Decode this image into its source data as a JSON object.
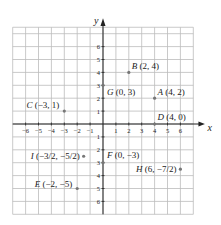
{
  "chart_data": {
    "type": "scatter",
    "title": "",
    "xlabel": "x",
    "ylabel": "y",
    "xlim": [
      -7,
      7
    ],
    "ylim": [
      -7,
      7
    ],
    "grid": true,
    "x_ticks": [
      -6,
      -5,
      -4,
      -3,
      -2,
      -1,
      1,
      2,
      3,
      4,
      5,
      6
    ],
    "y_ticks": [
      -6,
      -5,
      -4,
      -3,
      -2,
      -1,
      1,
      2,
      3,
      4,
      5,
      6
    ],
    "points": [
      {
        "name": "A",
        "x": 4,
        "y": 2,
        "label": "A (4, 2)"
      },
      {
        "name": "B",
        "x": 2,
        "y": 4,
        "label": "B (2, 4)"
      },
      {
        "name": "C",
        "x": -3,
        "y": 1,
        "label": "C (−3, 1)"
      },
      {
        "name": "D",
        "x": 4,
        "y": 0,
        "label": "D (4, 0)"
      },
      {
        "name": "E",
        "x": -2,
        "y": -5,
        "label": "E (−2, −5)"
      },
      {
        "name": "F",
        "x": 0,
        "y": -3,
        "label": "F (0, −3)"
      },
      {
        "name": "G",
        "x": 0,
        "y": 3,
        "label": "G (0, 3)"
      },
      {
        "name": "H",
        "x": 6,
        "y": -3.5,
        "label": "H (6, −7/2)"
      },
      {
        "name": "I",
        "x": -1.5,
        "y": -2.5,
        "label": "I (−3/2, −5/2)"
      }
    ]
  },
  "colors": {
    "grid": "#bbbbbb",
    "axis": "#222222",
    "point": "#777777",
    "text": "#222222"
  }
}
